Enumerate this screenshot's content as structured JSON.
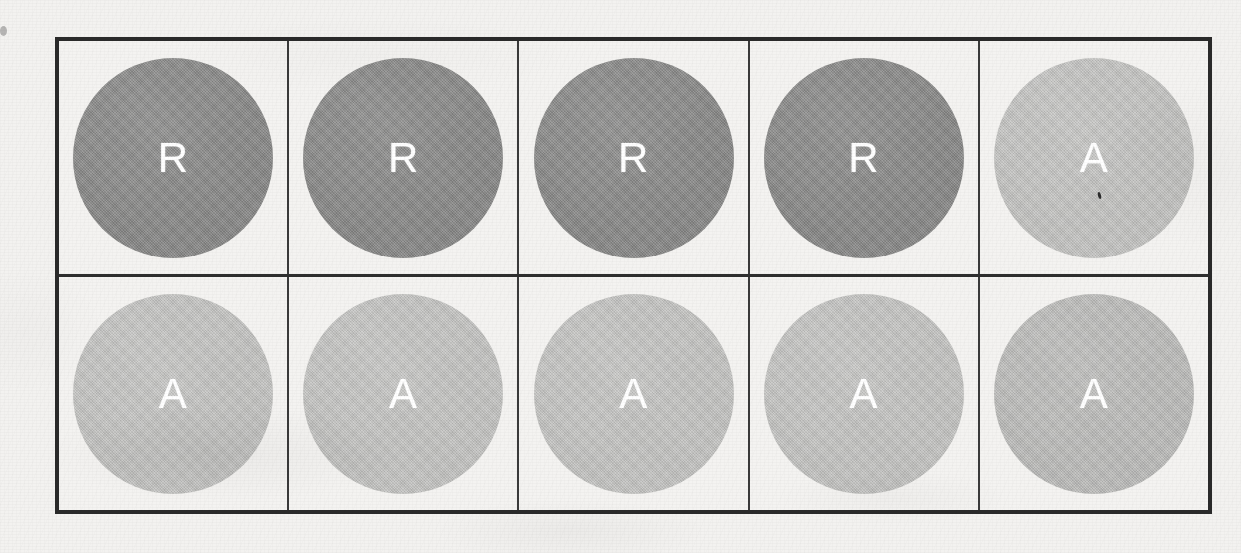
{
  "page": {
    "kind": "scanned-table-of-shaded-circles",
    "background_color": "#f3f2f0",
    "border_color": "#2a2a2a",
    "label_color": "#ffffff"
  },
  "table": {
    "rows": 2,
    "columns": 5,
    "cells": [
      [
        {
          "label": "R",
          "shade": "dark",
          "color": "#878786"
        },
        {
          "label": "R",
          "shade": "dark",
          "color": "#878786"
        },
        {
          "label": "R",
          "shade": "dark",
          "color": "#878786"
        },
        {
          "label": "R",
          "shade": "dark",
          "color": "#878786"
        },
        {
          "label": "A",
          "shade": "light",
          "color": "#c4c4c2"
        }
      ],
      [
        {
          "label": "A",
          "shade": "light",
          "color": "#c4c4c2"
        },
        {
          "label": "A",
          "shade": "light",
          "color": "#c4c4c2"
        },
        {
          "label": "A",
          "shade": "light",
          "color": "#c4c4c2"
        },
        {
          "label": "A",
          "shade": "light",
          "color": "#c4c4c2"
        },
        {
          "label": "A",
          "shade": "light-darker",
          "color": "#bcbcba"
        }
      ]
    ]
  },
  "artifacts": {
    "ink_speck": "ink-speck",
    "edge_mark": "edge-mark"
  }
}
